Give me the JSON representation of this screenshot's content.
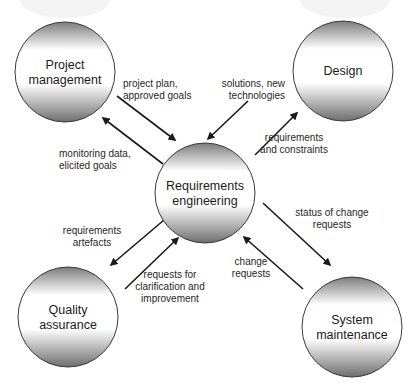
{
  "diagram": {
    "nodes": [
      {
        "id": "project-management",
        "lines": [
          "Project",
          "management"
        ]
      },
      {
        "id": "design",
        "lines": [
          "Design"
        ]
      },
      {
        "id": "requirements-engineering",
        "lines": [
          "Requirements",
          "engineering"
        ]
      },
      {
        "id": "quality-assurance",
        "lines": [
          "Quality",
          "assurance"
        ]
      },
      {
        "id": "system-maintenance",
        "lines": [
          "System",
          "maintenance"
        ]
      }
    ],
    "edges": [
      {
        "from": "project-management",
        "to": "requirements-engineering",
        "label_lines": [
          "project plan,",
          "approved goals"
        ]
      },
      {
        "from": "requirements-engineering",
        "to": "project-management",
        "label_lines": [
          "monitoring data,",
          "elicited goals"
        ]
      },
      {
        "from": "design",
        "to": "requirements-engineering",
        "label_lines": [
          "solutions, new",
          "technologies"
        ]
      },
      {
        "from": "requirements-engineering",
        "to": "design",
        "label_lines": [
          "requirements",
          "and constraints"
        ]
      },
      {
        "from": "requirements-engineering",
        "to": "quality-assurance",
        "label_lines": [
          "requirements",
          "artefacts"
        ]
      },
      {
        "from": "quality-assurance",
        "to": "requirements-engineering",
        "label_lines": [
          "requests for",
          "clarification and",
          "improvement"
        ]
      },
      {
        "from": "requirements-engineering",
        "to": "system-maintenance",
        "label_lines": [
          "status of change",
          "requests"
        ]
      },
      {
        "from": "system-maintenance",
        "to": "requirements-engineering",
        "label_lines": [
          "change",
          "requests"
        ]
      }
    ],
    "colors": {
      "stroke": "#3a3a3a",
      "gradient_dark": "#7a7a7a",
      "gradient_light": "#ffffff",
      "arrow": "#1a1a1a"
    }
  }
}
